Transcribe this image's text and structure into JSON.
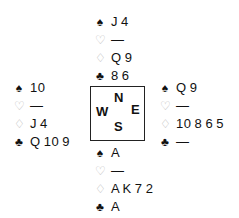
{
  "suits": {
    "spades": {
      "icon": "♠",
      "style": "black"
    },
    "hearts": {
      "icon": "♡",
      "style": "outline"
    },
    "diamonds": {
      "icon": "♢",
      "style": "outline"
    },
    "clubs": {
      "icon": "♣",
      "style": "black"
    }
  },
  "compass": {
    "north": "N",
    "west": "W",
    "east": "E",
    "south": "S"
  },
  "hands": {
    "north": {
      "spades": "J 4",
      "hearts": "—",
      "diamonds": "Q 9",
      "clubs": "8 6"
    },
    "west": {
      "spades": "10",
      "hearts": "—",
      "diamonds": "J 4",
      "clubs": "Q 10 9"
    },
    "east": {
      "spades": "Q 9",
      "hearts": "—",
      "diamonds": "10 8 6 5",
      "clubs": "—"
    },
    "south": {
      "spades": "A",
      "hearts": "—",
      "diamonds": "A K 7 2",
      "clubs": "A"
    }
  }
}
